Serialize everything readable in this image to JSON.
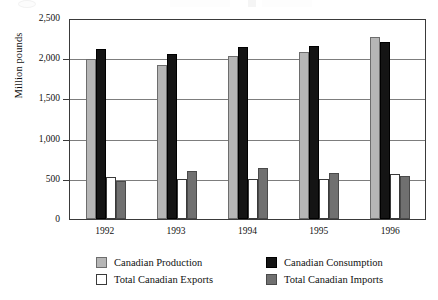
{
  "chart_data": {
    "type": "bar",
    "title": "",
    "xlabel": "",
    "ylabel": "Million pounds",
    "categories": [
      "1992",
      "1993",
      "1994",
      "1995",
      "1996"
    ],
    "ylim": [
      0,
      2500
    ],
    "yticks": [
      "0",
      "500",
      "1,000",
      "1,500",
      "2,000",
      "2,500"
    ],
    "ytick_values": [
      0,
      500,
      1000,
      1500,
      2000,
      2500
    ],
    "grid": true,
    "legend_position": "bottom",
    "series": [
      {
        "name": "Canadian Production",
        "color": "#b6b6b6",
        "values": [
          1985,
          1910,
          2030,
          2080,
          2260
        ]
      },
      {
        "name": "Canadian Consumption",
        "color": "#141414",
        "values": [
          2120,
          2055,
          2140,
          2150,
          2205
        ]
      },
      {
        "name": "Total Canadian Exports",
        "color": "#ffffff",
        "values": [
          525,
          500,
          495,
          495,
          555
        ]
      },
      {
        "name": "Total Canadian Imports",
        "color": "#707070",
        "values": [
          470,
          600,
          630,
          570,
          530
        ]
      }
    ]
  },
  "legend": {
    "items": [
      {
        "label": "Canadian Production",
        "swatch": "production"
      },
      {
        "label": "Canadian Consumption",
        "swatch": "consumption"
      },
      {
        "label": "Total Canadian Exports",
        "swatch": "exports"
      },
      {
        "label": "Total Canadian Imports",
        "swatch": "imports"
      }
    ]
  }
}
